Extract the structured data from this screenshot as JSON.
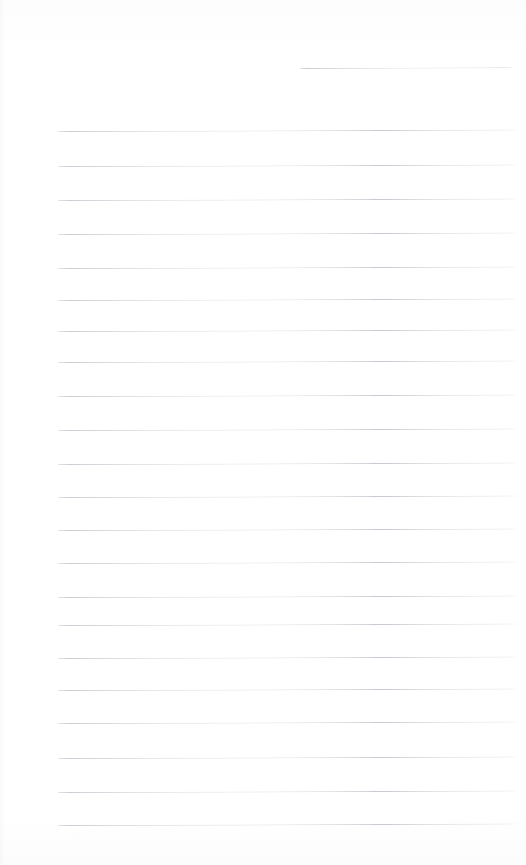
{
  "document": {
    "kind": "scanned-ruled-notebook-page",
    "title": "Blank lined page",
    "page_width": 526,
    "page_height": 865,
    "background_color": "#ffffff",
    "rule_color": "#c9cbd2",
    "rule_thickness": 1,
    "text_content": "",
    "has_handwriting": false,
    "has_printed_text": false,
    "margins": {
      "left": 58,
      "right": 517,
      "top_first_rule": 68,
      "bottom_last_rule": 825
    },
    "layout": {
      "rule_spacing": 34.2,
      "full_rule_count": 21,
      "partial_rule_count": 1,
      "total_rule_count": 22,
      "tilt_degrees": -0.18
    },
    "rules": [
      {
        "id": "rule-partial-top",
        "y": 68,
        "x_start": 300,
        "x_end": 512,
        "partial": true
      },
      {
        "id": "rule-1",
        "y": 131,
        "x_start": 58,
        "x_end": 517,
        "partial": false
      },
      {
        "id": "rule-2",
        "y": 166,
        "x_start": 58,
        "x_end": 517,
        "partial": false
      },
      {
        "id": "rule-3",
        "y": 200,
        "x_start": 58,
        "x_end": 517,
        "partial": false
      },
      {
        "id": "rule-4",
        "y": 234,
        "x_start": 58,
        "x_end": 517,
        "partial": false
      },
      {
        "id": "rule-5",
        "y": 268,
        "x_start": 58,
        "x_end": 517,
        "partial": false
      },
      {
        "id": "rule-6",
        "y": 300,
        "x_start": 58,
        "x_end": 517,
        "partial": false
      },
      {
        "id": "rule-7",
        "y": 331,
        "x_start": 58,
        "x_end": 517,
        "partial": false
      },
      {
        "id": "rule-8",
        "y": 362,
        "x_start": 58,
        "x_end": 517,
        "partial": false
      },
      {
        "id": "rule-9",
        "y": 396,
        "x_start": 58,
        "x_end": 517,
        "partial": false
      },
      {
        "id": "rule-10",
        "y": 430,
        "x_start": 58,
        "x_end": 517,
        "partial": false
      },
      {
        "id": "rule-11",
        "y": 464,
        "x_start": 58,
        "x_end": 517,
        "partial": false
      },
      {
        "id": "rule-12",
        "y": 497,
        "x_start": 58,
        "x_end": 517,
        "partial": false
      },
      {
        "id": "rule-13",
        "y": 530,
        "x_start": 58,
        "x_end": 517,
        "partial": false
      },
      {
        "id": "rule-14",
        "y": 563,
        "x_start": 58,
        "x_end": 517,
        "partial": false
      },
      {
        "id": "rule-15",
        "y": 597,
        "x_start": 58,
        "x_end": 517,
        "partial": false
      },
      {
        "id": "rule-16",
        "y": 625,
        "x_start": 58,
        "x_end": 517,
        "partial": false
      },
      {
        "id": "rule-17",
        "y": 658,
        "x_start": 58,
        "x_end": 517,
        "partial": false
      },
      {
        "id": "rule-18",
        "y": 690,
        "x_start": 58,
        "x_end": 517,
        "partial": false
      },
      {
        "id": "rule-19",
        "y": 723,
        "x_start": 58,
        "x_end": 517,
        "partial": false
      },
      {
        "id": "rule-20",
        "y": 758,
        "x_start": 58,
        "x_end": 517,
        "partial": false
      },
      {
        "id": "rule-21",
        "y": 792,
        "x_start": 58,
        "x_end": 517,
        "partial": false
      },
      {
        "id": "rule-22",
        "y": 825,
        "x_start": 58,
        "x_end": 517,
        "partial": false
      }
    ]
  }
}
